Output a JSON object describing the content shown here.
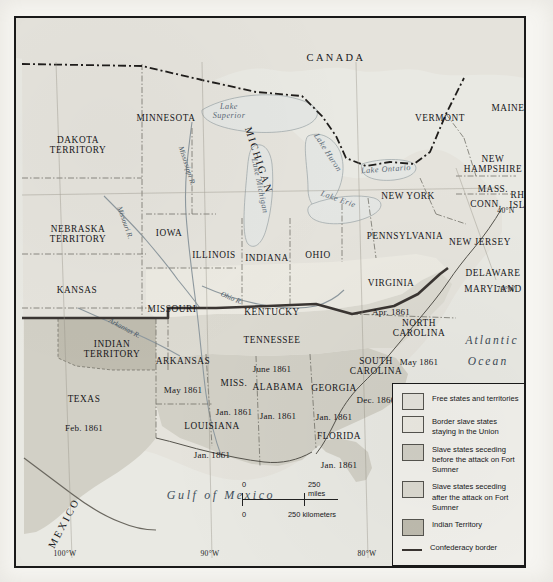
{
  "map": {
    "title": "Secession of the Southern States, 1860-1861",
    "countries": [
      {
        "name": "CANADA",
        "x": 320,
        "y": 40
      },
      {
        "name": "MEXICO",
        "x": 48,
        "y": 505,
        "rotate": -62
      }
    ],
    "oceans": [
      {
        "name": "Atlantic",
        "x": 476,
        "y": 322
      },
      {
        "name": "Ocean",
        "x": 472,
        "y": 343
      }
    ],
    "gulf": {
      "name": "Gulf of Mexico",
      "x": 205,
      "y": 477
    },
    "lakes": [
      {
        "name": "Lake\nSuperior",
        "x": 213,
        "y": 94
      },
      {
        "name": "Lake Michigan",
        "x": 243,
        "y": 168,
        "rotate": 78
      },
      {
        "name": "Lake Huron",
        "x": 311,
        "y": 135,
        "rotate": 57
      },
      {
        "name": "Lake Erie",
        "x": 322,
        "y": 182,
        "rotate": 20
      },
      {
        "name": "Lake Ontario",
        "x": 370,
        "y": 152,
        "rotate": -4
      }
    ],
    "rivers": [
      {
        "name": "Mississippi R.",
        "x": 170,
        "y": 148,
        "rotate": 72
      },
      {
        "name": "Missouri R.",
        "x": 108,
        "y": 205,
        "rotate": 70
      },
      {
        "name": "Ohio R.",
        "x": 215,
        "y": 281,
        "rotate": 22
      },
      {
        "name": "Arkansas R.",
        "x": 108,
        "y": 311,
        "rotate": 28
      }
    ],
    "states": [
      {
        "name": "DAKOTA\nTERRITORY",
        "date": "",
        "x": 62,
        "y": 127,
        "kind": "free"
      },
      {
        "name": "MINNESOTA",
        "date": "",
        "x": 150,
        "y": 100,
        "kind": "free"
      },
      {
        "name": "MICHIGAN",
        "date": "",
        "x": 253,
        "y": 139,
        "kind": "free",
        "rotate": 72
      },
      {
        "name": "VERMONT",
        "date": "",
        "x": 424,
        "y": 90,
        "kind": "free"
      },
      {
        "name": "MAINE",
        "date": "",
        "x": 492,
        "y": 80,
        "kind": "free"
      },
      {
        "name": "NEW\nHAMPSHIRE",
        "date": "",
        "x": 477,
        "y": 136,
        "kind": "free"
      },
      {
        "name": "NEW YORK",
        "date": "",
        "x": 392,
        "y": 168,
        "kind": "free"
      },
      {
        "name": "MASS.",
        "date": "",
        "x": 477,
        "y": 161,
        "kind": "free"
      },
      {
        "name": "CONN.",
        "date": "",
        "x": 470,
        "y": 176,
        "kind": "free"
      },
      {
        "name": "RHODE\nISLAND",
        "date": "",
        "x": 512,
        "y": 172,
        "kind": "free"
      },
      {
        "name": "NEBRASKA\nTERRITORY",
        "date": "",
        "x": 62,
        "y": 206,
        "kind": "free"
      },
      {
        "name": "IOWA",
        "date": "",
        "x": 153,
        "y": 205,
        "kind": "free"
      },
      {
        "name": "ILLINOIS",
        "date": "",
        "x": 198,
        "y": 227,
        "kind": "free"
      },
      {
        "name": "INDIANA",
        "date": "",
        "x": 251,
        "y": 230,
        "kind": "free"
      },
      {
        "name": "OHIO",
        "date": "",
        "x": 302,
        "y": 227,
        "kind": "free"
      },
      {
        "name": "PENNSYLVANIA",
        "date": "",
        "x": 389,
        "y": 208,
        "kind": "free"
      },
      {
        "name": "NEW JERSEY",
        "date": "",
        "x": 464,
        "y": 214,
        "kind": "free"
      },
      {
        "name": "KANSAS",
        "date": "",
        "x": 61,
        "y": 262,
        "kind": "free"
      },
      {
        "name": "MISSOURI",
        "date": "",
        "x": 156,
        "y": 281,
        "kind": "border"
      },
      {
        "name": "KENTUCKY",
        "date": "",
        "x": 256,
        "y": 284,
        "kind": "border"
      },
      {
        "name": "DELAWARE",
        "date": "",
        "x": 477,
        "y": 245,
        "kind": "border"
      },
      {
        "name": "MARYLAND",
        "date": "",
        "x": 477,
        "y": 261,
        "kind": "border"
      },
      {
        "name": "VIRGINIA",
        "date": "Apr. 1861",
        "x": 375,
        "y": 270,
        "kind": "after"
      },
      {
        "name": "NORTH\nCAROLINA",
        "date": "May 1861",
        "x": 403,
        "y": 315,
        "kind": "after"
      },
      {
        "name": "TENNESSEE",
        "date": "June 1861",
        "x": 256,
        "y": 327,
        "kind": "after"
      },
      {
        "name": "ARKANSAS",
        "date": "May 1861",
        "x": 167,
        "y": 348,
        "kind": "after"
      },
      {
        "name": "SOUTH\nCAROLINA",
        "date": "Dec. 1860",
        "x": 360,
        "y": 353,
        "kind": "before"
      },
      {
        "name": "MISS.",
        "date": "Jan. 1861",
        "x": 218,
        "y": 370,
        "kind": "before"
      },
      {
        "name": "ALABAMA",
        "date": "Jan. 1861",
        "x": 262,
        "y": 374,
        "kind": "before"
      },
      {
        "name": "GEORGIA",
        "date": "Jan. 1861",
        "x": 318,
        "y": 375,
        "kind": "before"
      },
      {
        "name": "LOUISIANA",
        "date": "Jan. 1861",
        "x": 196,
        "y": 413,
        "kind": "before"
      },
      {
        "name": "TEXAS",
        "date": "Feb. 1861",
        "x": 68,
        "y": 386,
        "kind": "before"
      },
      {
        "name": "FLORIDA",
        "date": "Jan. 1861",
        "x": 323,
        "y": 423,
        "kind": "before"
      },
      {
        "name": "INDIAN\nTERRITORY",
        "date": "",
        "x": 96,
        "y": 321,
        "kind": "indian"
      }
    ],
    "coordinates": [
      {
        "label": "40°N",
        "x": 490,
        "y": 193
      },
      {
        "label": "70°W",
        "x": 490,
        "y": 272
      },
      {
        "label": "100°W",
        "x": 49,
        "y": 552
      },
      {
        "label": "90°W",
        "x": 194,
        "y": 552
      },
      {
        "label": "80°W",
        "x": 351,
        "y": 552
      }
    ]
  },
  "legend": {
    "items": [
      {
        "label": "Free states and territories",
        "color": "#e5e3dc",
        "type": "swatch"
      },
      {
        "label": "Border slave states\nstaying in the Union",
        "color": "#eceae2",
        "type": "swatch"
      },
      {
        "label": "Slave states seceding before\nthe attack on Fort Sumner",
        "color": "#d2d0c6",
        "type": "swatch"
      },
      {
        "label": "Slave states seceding after\nthe attack on Fort Sumner",
        "color": "#dcdad1",
        "type": "swatch"
      },
      {
        "label": "Indian Territory",
        "color": "#bfbcaf",
        "type": "swatch"
      },
      {
        "label": "Confederacy border",
        "color": "#3a3532",
        "type": "line"
      }
    ]
  },
  "scale": {
    "miles": {
      "start": "0",
      "end": "250 miles"
    },
    "kilometers": {
      "start": "0",
      "end": "250 kilometers"
    }
  },
  "colors": {
    "free": "#e5e3dc",
    "border_state": "#eceae2",
    "seceded_before": "#d2d0c6",
    "seceded_after": "#dcdad1",
    "indian": "#bfbcaf",
    "water": "#e9e9e3",
    "confederacy_border": "#3a3532",
    "ink": "#17171a"
  }
}
